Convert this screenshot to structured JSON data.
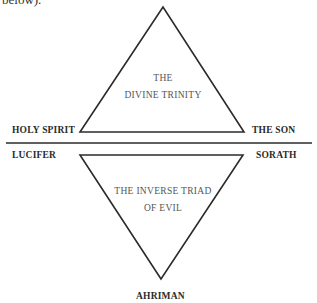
{
  "header_fragment": "below).",
  "top_triangle": {
    "text_line1": "THE",
    "text_line2": "DIVINE TRINITY",
    "left_label": "HOLY SPIRIT",
    "right_label": "THE SON"
  },
  "bottom_triangle": {
    "text_line1": "THE INVERSE TRIAD",
    "text_line2": "OF EVIL",
    "left_label": "LUCIFER",
    "right_label": "SORATH",
    "bottom_label": "AHRIMAN"
  },
  "colors": {
    "line": "#2b2b2b",
    "text": "#2a2a2a",
    "inner_text": "#555555"
  }
}
